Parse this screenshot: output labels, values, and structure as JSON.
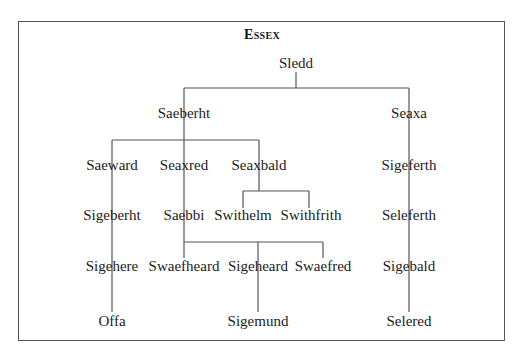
{
  "title": "Essex",
  "nodes": {
    "sledd": "Sledd",
    "saeberht": "Saeberht",
    "seaxa": "Seaxa",
    "saeward": "Saeward",
    "seaxred": "Seaxred",
    "seaxbald": "Seaxbald",
    "sigeferth": "Sigeferth",
    "sigeberht": "Sigeberht",
    "saebbi": "Saebbi",
    "swithelm": "Swithelm",
    "swithfrith": "Swithfrith",
    "seleferth": "Seleferth",
    "sigehere": "Sigehere",
    "swaefheard": "Swaefheard",
    "sigeheard": "Sigeheard",
    "swaefred": "Swaefred",
    "sigebald": "Sigebald",
    "offa": "Offa",
    "sigemund": "Sigemund",
    "selered": "Selered"
  },
  "colors": {
    "line": "#555555",
    "text": "#222222",
    "border": "#555555"
  }
}
